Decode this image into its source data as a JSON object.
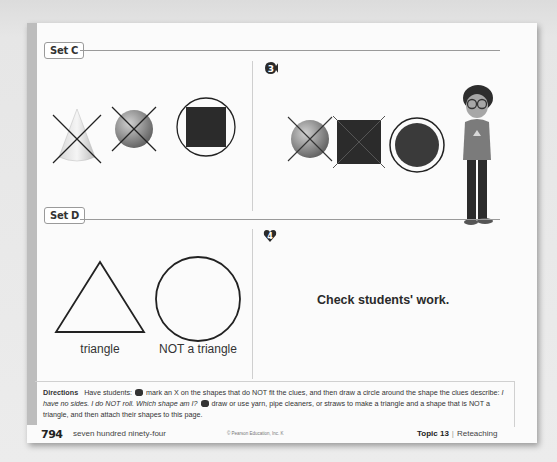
{
  "sections": {
    "set_c": {
      "label": "Set C",
      "example_shapes": [
        {
          "shape": "cone",
          "mark": "x"
        },
        {
          "shape": "sphere",
          "mark": "x"
        },
        {
          "shape": "cube",
          "mark": "circle"
        }
      ],
      "problem_number": "3",
      "problem_shapes": [
        {
          "shape": "sphere",
          "mark": "x"
        },
        {
          "shape": "cube",
          "mark": "x"
        },
        {
          "shape": "cylinder",
          "mark": "circle"
        }
      ]
    },
    "set_d": {
      "label": "Set D",
      "example_shapes": [
        {
          "shape": "triangle",
          "caption": "triangle"
        },
        {
          "shape": "circle",
          "caption": "NOT a triangle"
        }
      ],
      "problem_number": "4",
      "answer_text": "Check students' work."
    }
  },
  "directions": {
    "heading": "Directions",
    "lead": "Have students:",
    "part3_a": "mark an X on the shapes that do NOT fit the clues, and then draw a circle around the shape the clues describe:",
    "part3_clue": "I have no sides. I do NOT roll. Which shape am I?",
    "part4": "draw or use yarn, pipe cleaners, or straws to make a triangle and a shape that is NOT a triangle, and then attach their shapes to this page."
  },
  "footer": {
    "page_number": "794",
    "page_words": "seven hundred ninety-four",
    "copyright": "© Pearson Education, Inc. K",
    "topic_label": "Topic 13",
    "section_name": "Reteaching"
  },
  "character": {
    "description": "cartoon girl with glasses"
  }
}
